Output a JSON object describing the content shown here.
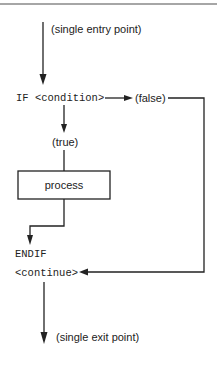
{
  "diagram": {
    "type": "flowchart",
    "entry_label": "(single entry point)",
    "condition_label": "IF <condition>",
    "false_label": "(false)",
    "true_label": "(true)",
    "process_label": "process",
    "endif_label": "ENDIF",
    "continue_label": "<continue>",
    "exit_label": "(single exit point)",
    "colors": {
      "line": "#222222",
      "background": "#ffffff",
      "top_rule": "#888888"
    }
  }
}
